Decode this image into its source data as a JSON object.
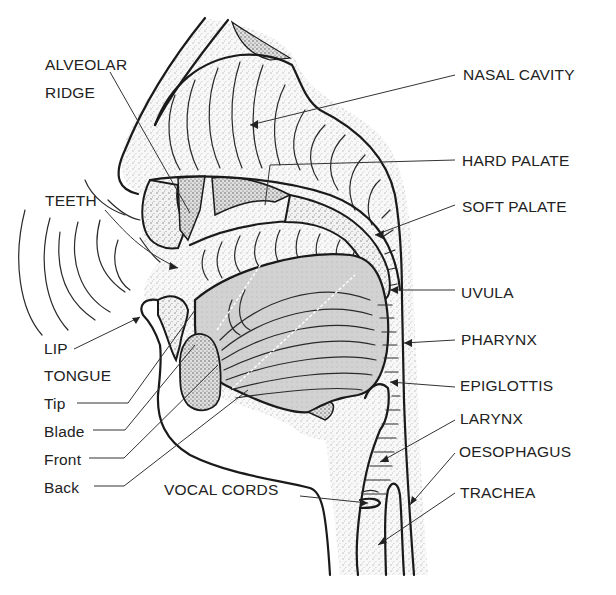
{
  "figure": {
    "colors": {
      "ink": "#1a1a1a",
      "stipple_shade": "#d9d9d9",
      "tongue_shade": "#cfcfcf",
      "background": "#ffffff"
    }
  },
  "labels": {
    "left": [
      {
        "id": "alveolar-ridge",
        "text": "ALVEOLAR",
        "x": 45,
        "y": 56
      },
      {
        "id": "alveolar-ridge-2",
        "text": "RIDGE",
        "x": 45,
        "y": 84
      },
      {
        "id": "teeth",
        "text": "TEETH",
        "x": 45,
        "y": 192
      },
      {
        "id": "lip",
        "text": "LIP",
        "x": 44,
        "y": 344
      },
      {
        "id": "tongue",
        "text": "TONGUE",
        "x": 44,
        "y": 371
      },
      {
        "id": "tip",
        "text": "Tip",
        "x": 44,
        "y": 399
      },
      {
        "id": "blade",
        "text": "Blade",
        "x": 44,
        "y": 427
      },
      {
        "id": "front",
        "text": "Front",
        "x": 44,
        "y": 455
      },
      {
        "id": "back",
        "text": "Back",
        "x": 44,
        "y": 483
      }
    ],
    "right": [
      {
        "id": "nasal-cavity",
        "text": "NASAL CAVITY",
        "x": 463,
        "y": 67
      },
      {
        "id": "hard-palate",
        "text": "HARD PALATE",
        "x": 462,
        "y": 156
      },
      {
        "id": "soft-palate",
        "text": "SOFT PALATE",
        "x": 462,
        "y": 200
      },
      {
        "id": "uvula",
        "text": "UVULA",
        "x": 461,
        "y": 286
      },
      {
        "id": "pharynx",
        "text": "PHARYNX",
        "x": 461,
        "y": 333
      },
      {
        "id": "epiglottis",
        "text": "EPIGLOTTIS",
        "x": 460,
        "y": 380
      },
      {
        "id": "larynx",
        "text": "LARYNX",
        "x": 460,
        "y": 413
      },
      {
        "id": "oesophagus",
        "text": "OESOPHAGUS",
        "x": 459,
        "y": 446
      },
      {
        "id": "trachea",
        "text": "TRACHEA",
        "x": 460,
        "y": 487
      }
    ],
    "bottom": [
      {
        "id": "vocal-cords",
        "text": "VOCAL CORDS",
        "x": 164,
        "y": 484
      }
    ]
  }
}
